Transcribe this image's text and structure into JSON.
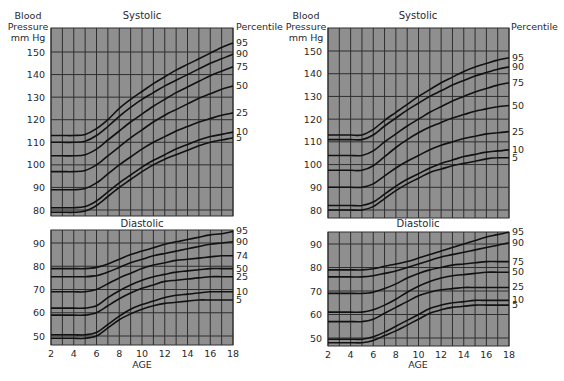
{
  "chart_data": [
    {
      "type": "line",
      "panel": "left",
      "title": "Systolic",
      "ylabel": "Blood Pressure mm Hg",
      "xlabel": "AGE",
      "legend_title": "Percentile",
      "ylim": [
        77,
        157
      ],
      "xlim": [
        2,
        18
      ],
      "yticks": [
        80,
        90,
        100,
        110,
        120,
        130,
        140,
        150
      ],
      "xticks": [
        2,
        4,
        6,
        8,
        10,
        12,
        14,
        16,
        18
      ],
      "grid": true,
      "x": [
        2,
        3,
        4,
        5,
        6,
        7,
        8,
        9,
        10,
        11,
        12,
        13,
        14,
        15,
        16,
        17,
        18
      ],
      "series": [
        {
          "name": "95",
          "values": [
            113,
            113,
            113,
            113.5,
            116,
            120,
            125,
            129,
            132.5,
            136,
            139,
            142,
            144.5,
            147,
            149.5,
            152,
            154
          ]
        },
        {
          "name": "90",
          "values": [
            110,
            110,
            110,
            110.5,
            113,
            117,
            121.5,
            125.5,
            129,
            132,
            135,
            137.5,
            140,
            142.5,
            145,
            147,
            149
          ]
        },
        {
          "name": "75",
          "values": [
            104,
            104,
            104,
            104.5,
            107,
            111,
            115,
            119,
            122.5,
            126,
            129,
            132,
            134.5,
            137,
            139.5,
            141.5,
            143.5
          ]
        },
        {
          "name": "50",
          "values": [
            97,
            97,
            97,
            97.5,
            100,
            104,
            108,
            112,
            115.5,
            119,
            122,
            124.5,
            127,
            129.5,
            131.5,
            133.5,
            135
          ]
        },
        {
          "name": "25",
          "values": [
            89,
            89,
            89,
            89.5,
            92,
            96,
            100,
            103.5,
            107,
            110,
            112.5,
            115,
            117,
            119,
            120.5,
            122,
            123
          ]
        },
        {
          "name": "10",
          "values": [
            81,
            81,
            81,
            81.5,
            84,
            88,
            92,
            95.5,
            99,
            102,
            104.5,
            107,
            109,
            111,
            112.5,
            113.5,
            114.5
          ]
        },
        {
          "name": "5",
          "values": [
            79,
            79,
            79,
            79.5,
            82,
            86,
            90,
            93.5,
            97,
            100,
            102.5,
            104.5,
            106.5,
            108.5,
            110,
            111,
            112
          ]
        }
      ],
      "right_labels": [
        "95",
        "90",
        "75",
        "50",
        "25",
        "10",
        "5"
      ]
    },
    {
      "type": "line",
      "panel": "left",
      "title": "Diastolic",
      "xlabel": "AGE",
      "ylim": [
        47,
        96
      ],
      "xlim": [
        2,
        18
      ],
      "yticks": [
        50,
        60,
        70,
        80,
        90
      ],
      "xticks": [
        2,
        4,
        6,
        8,
        10,
        12,
        14,
        16,
        18
      ],
      "grid": true,
      "x": [
        2,
        3,
        4,
        5,
        6,
        7,
        8,
        9,
        10,
        11,
        12,
        13,
        14,
        15,
        16,
        17,
        18
      ],
      "series": [
        {
          "name": "95",
          "values": [
            79,
            79,
            79,
            79,
            79.5,
            81,
            83,
            85,
            86.5,
            88,
            89.5,
            90.5,
            91.5,
            92.5,
            93.5,
            94,
            95
          ]
        },
        {
          "name": "90",
          "values": [
            75.5,
            75.5,
            75.5,
            75.5,
            76,
            77.5,
            79.5,
            81.5,
            83,
            84.5,
            85.5,
            86.5,
            87.5,
            88.5,
            89.5,
            90,
            90.5
          ]
        },
        {
          "name": "74",
          "values": [
            69,
            69,
            69,
            69,
            70,
            72.5,
            75,
            77,
            79,
            80.5,
            81.5,
            82.5,
            83,
            83.5,
            84,
            84.5,
            84.5
          ]
        },
        {
          "name": "50",
          "values": [
            62,
            62,
            62,
            62,
            63,
            66.5,
            69.5,
            72,
            74,
            75.5,
            76.5,
            77.5,
            78,
            78.5,
            79,
            79,
            79
          ]
        },
        {
          "name": "25",
          "values": [
            59,
            59,
            59,
            59,
            60,
            63,
            66,
            68.5,
            70.5,
            72,
            73.5,
            74,
            74.5,
            75,
            75.5,
            75.5,
            75.5
          ]
        },
        {
          "name": "10",
          "values": [
            50.5,
            50.5,
            50.5,
            50.5,
            51.5,
            55,
            58.5,
            61.5,
            63.5,
            65,
            66.5,
            67.5,
            68,
            68.5,
            69,
            69,
            69
          ]
        },
        {
          "name": "5",
          "values": [
            49,
            49,
            49,
            49,
            50,
            53.5,
            57,
            59.5,
            61.5,
            63,
            64,
            64.5,
            65,
            65.5,
            65.5,
            65.5,
            65.5
          ]
        }
      ],
      "right_labels": [
        "95",
        "90",
        "74",
        "50",
        "25",
        "10",
        "5"
      ]
    },
    {
      "type": "line",
      "panel": "right",
      "title": "Systolic",
      "ylabel": "Blood Pressure mm Hg",
      "xlabel": "AGE",
      "legend_title": "Percentile",
      "ylim": [
        77,
        157
      ],
      "xlim": [
        2,
        18
      ],
      "yticks": [
        80,
        90,
        100,
        110,
        120,
        130,
        140,
        150
      ],
      "xticks": [
        2,
        4,
        6,
        8,
        10,
        12,
        14,
        16,
        18
      ],
      "grid": true,
      "x": [
        2,
        3,
        4,
        5,
        6,
        7,
        8,
        9,
        10,
        11,
        12,
        13,
        14,
        15,
        16,
        17,
        18
      ],
      "series": [
        {
          "name": "95",
          "values": [
            113,
            113,
            113,
            113,
            115.5,
            119.5,
            123,
            126.5,
            130,
            133,
            136,
            138.5,
            141,
            143,
            144.5,
            146,
            147
          ]
        },
        {
          "name": "90",
          "values": [
            111,
            111,
            111,
            111,
            113,
            117,
            120.5,
            124,
            127,
            130,
            132.5,
            135,
            137,
            139,
            140.5,
            142,
            143
          ]
        },
        {
          "name": "75",
          "values": [
            104,
            104,
            104,
            104,
            106,
            110,
            113.5,
            117,
            120,
            123,
            125.5,
            128,
            130,
            132,
            133.5,
            135,
            136
          ]
        },
        {
          "name": "50",
          "values": [
            97.5,
            97.5,
            97.5,
            97.5,
            99.5,
            103.5,
            107.5,
            111,
            114,
            116.5,
            118.5,
            120.5,
            122,
            123.5,
            124.5,
            125.5,
            126
          ]
        },
        {
          "name": "25",
          "values": [
            90,
            90,
            90,
            90,
            91.5,
            95,
            98.5,
            101.5,
            104,
            106.5,
            108.5,
            110,
            111.5,
            112.5,
            113.5,
            114,
            114.5
          ]
        },
        {
          "name": "10",
          "values": [
            82,
            82,
            82,
            82,
            83.5,
            87,
            90.5,
            93.5,
            96,
            98.5,
            100.5,
            102,
            103.5,
            104.5,
            105.5,
            106,
            106.5
          ]
        },
        {
          "name": "5",
          "values": [
            80,
            80,
            80,
            80,
            81.5,
            85,
            88.5,
            91.5,
            94,
            96.5,
            98,
            99.5,
            100.5,
            101.5,
            102.5,
            103,
            103
          ]
        }
      ],
      "right_labels": [
        "95",
        "90",
        "75",
        "50",
        "25",
        "10",
        "5"
      ]
    },
    {
      "type": "line",
      "panel": "right",
      "title": "Diastolic",
      "xlabel": "AGE",
      "ylim": [
        47,
        96
      ],
      "xlim": [
        2,
        18
      ],
      "yticks": [
        50,
        60,
        70,
        80,
        90
      ],
      "xticks": [
        2,
        4,
        6,
        8,
        10,
        12,
        14,
        16,
        18
      ],
      "grid": true,
      "x": [
        2,
        3,
        4,
        5,
        6,
        7,
        8,
        9,
        10,
        11,
        12,
        13,
        14,
        15,
        16,
        17,
        18
      ],
      "series": [
        {
          "name": "95",
          "values": [
            79,
            79,
            79,
            79,
            79.5,
            80.5,
            81.5,
            82.5,
            84,
            85.5,
            87,
            88.5,
            90,
            91.5,
            93,
            94,
            95
          ]
        },
        {
          "name": "90",
          "values": [
            76,
            76,
            76,
            76,
            76.5,
            77.5,
            78.5,
            80,
            81.5,
            83,
            84.5,
            85.5,
            86.5,
            87.5,
            88.5,
            89.5,
            90.5
          ]
        },
        {
          "name": "75",
          "values": [
            69,
            69,
            69,
            69,
            69.5,
            71,
            73,
            75.5,
            77.5,
            79,
            80,
            81,
            81.5,
            82,
            82.5,
            82.5,
            82.5
          ]
        },
        {
          "name": "50",
          "values": [
            61,
            61,
            61,
            61,
            62,
            64,
            66.5,
            69.5,
            72,
            74,
            75.5,
            76.5,
            77,
            77.5,
            78,
            78,
            78
          ]
        },
        {
          "name": "25",
          "values": [
            57,
            57,
            57,
            57,
            58,
            60.5,
            63,
            65.5,
            68,
            69.5,
            70.5,
            71,
            71.5,
            71.5,
            71.5,
            71.5,
            71.5
          ]
        },
        {
          "name": "10",
          "values": [
            49.5,
            49.5,
            49.5,
            49.5,
            50.5,
            52.5,
            55,
            57.5,
            60,
            62.5,
            64,
            65,
            65.5,
            66,
            66,
            66,
            66
          ]
        },
        {
          "name": "5",
          "values": [
            48,
            48,
            48,
            48,
            49,
            51,
            53,
            55.5,
            58,
            60.5,
            62,
            63,
            63.5,
            64,
            64,
            64,
            64
          ]
        }
      ],
      "right_labels": [
        "95",
        "90",
        "75",
        "50",
        "25",
        "10",
        "5"
      ]
    }
  ],
  "labels": {
    "left": {
      "ylabel_lines": [
        "Blood",
        "Pressure",
        "mm Hg"
      ],
      "systolic_title": "Systolic",
      "diastolic_title": "Diastolic",
      "percentile_title": "Percentile",
      "xlabel": "AGE"
    },
    "right": {
      "ylabel_lines": [
        "Blood",
        "Pressure",
        "mm Hg"
      ],
      "systolic_title": "Systolic",
      "diastolic_title": "Diastolic",
      "percentile_title": "Percentile",
      "xlabel": "AGE"
    }
  },
  "colors": {
    "plot_bg": "#8f8f8f",
    "grid": "#2e2e2e",
    "curve": "#111111",
    "text": "#2a2a2a"
  }
}
